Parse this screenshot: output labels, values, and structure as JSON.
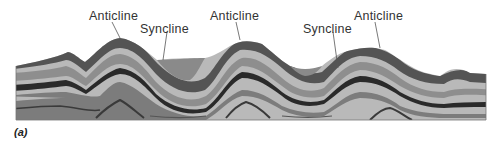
{
  "figure": {
    "caption": "(a)",
    "labels": [
      {
        "id": "anticline-1",
        "text": "Anticline",
        "x": 89,
        "y": 9
      },
      {
        "id": "syncline-1",
        "text": "Syncline",
        "x": 168,
        "y": 22
      },
      {
        "id": "anticline-2",
        "text": "Anticline",
        "x": 210,
        "y": 9
      },
      {
        "id": "syncline-2",
        "text": "Syncline",
        "x": 303,
        "y": 22
      },
      {
        "id": "anticline-3",
        "text": "Anticline",
        "x": 354,
        "y": 9
      }
    ],
    "colors": {
      "light_layer": "#b8b8b8",
      "mid_layer": "#8c8c8c",
      "dark_layer": "#4a4a4a",
      "darkest_band": "#262626",
      "syncline_fill": "#8a8a8a",
      "label_text": "#333333"
    }
  }
}
